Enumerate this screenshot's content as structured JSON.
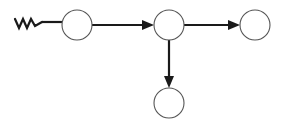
{
  "canvas": {
    "width": 284,
    "height": 126,
    "background": "#ffffff",
    "title": "Node Graph Diagram"
  },
  "style": {
    "node_stroke": "#555555",
    "node_stroke_width": 1.1,
    "node_fill": "#ffffff",
    "edge_stroke": "#1a1a1a",
    "edge_stroke_width": 2.2,
    "arrow_fill": "#1a1a1a",
    "squiggle_stroke": "#1a1a1a",
    "squiggle_stroke_width": 2.2
  },
  "nodes": [
    {
      "id": "node-1",
      "name": "node-left",
      "label": "",
      "cx": 77,
      "cy": 25,
      "r": 15
    },
    {
      "id": "node-2",
      "name": "node-center",
      "label": "",
      "cx": 169,
      "cy": 25,
      "r": 15
    },
    {
      "id": "node-3",
      "name": "node-right",
      "label": "",
      "cx": 255,
      "cy": 25,
      "r": 15
    },
    {
      "id": "node-4",
      "name": "node-bottom",
      "label": "",
      "cx": 169,
      "cy": 103,
      "r": 15
    }
  ],
  "edges": [
    {
      "id": "edge-source-to-node1",
      "name": "edge-source-to-left-node",
      "from": "squiggle-source",
      "to": "node-1",
      "arrowhead": false,
      "path": "M 42 22 L 62 22"
    },
    {
      "id": "edge-node1-to-node2",
      "name": "edge-left-to-center",
      "from": "node-1",
      "to": "node-2",
      "arrowhead": true,
      "path": "M 92 25 L 146 25",
      "arrow_points": "154,25 142,20 142,30"
    },
    {
      "id": "edge-node2-to-node3",
      "name": "edge-center-to-right",
      "from": "node-2",
      "to": "node-3",
      "arrowhead": true,
      "path": "M 184 25 L 232 25",
      "arrow_points": "240,25 228,20 228,30"
    },
    {
      "id": "edge-node2-to-node4",
      "name": "edge-center-to-bottom",
      "from": "node-2",
      "to": "node-4",
      "arrowhead": true,
      "path": "M 169 40 L 169 80",
      "arrow_points": "169,88 164,76 174,76"
    }
  ],
  "source_marker": {
    "id": "squiggle-source",
    "name": "squiggle-source-marker",
    "kind": "zigzag",
    "path": "M 15 19 L 19 28 L 23 19 L 27 28 L 31 19 L 35 26 L 42 22"
  }
}
